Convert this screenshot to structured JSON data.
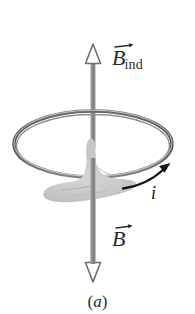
{
  "figure": {
    "caption": {
      "open_paren": "(",
      "letter": "a",
      "close_paren": ")",
      "full": "(a)"
    },
    "labels": {
      "b_induced": {
        "symbol": "B",
        "subscript": "ind",
        "full": "B_ind",
        "vector_arrow": "→",
        "color": "#2b2b2b"
      },
      "b_field": {
        "symbol": "B",
        "subscript": "",
        "full": "B",
        "vector_arrow": "→",
        "color": "#2b2b2b"
      },
      "current": {
        "symbol": "i",
        "full": "i",
        "color": "#141414"
      }
    },
    "elements": {
      "axis_arrow_up": {
        "name": "B-induced vertical arrow pointing up",
        "direction": "up",
        "head_style": "hollow-triangle",
        "shaft_color": "#8d8d8d",
        "outline_color": "#6f6f6f"
      },
      "axis_arrow_down": {
        "name": "B vertical arrow pointing down",
        "direction": "down",
        "head_style": "hollow-triangle",
        "shaft_color": "#8d8d8d",
        "outline_color": "#6f6f6f"
      },
      "conducting_loop": {
        "name": "circular conducting loop drawn in perspective as ellipse",
        "stroke_color": "#5e5e5e",
        "fill": "none"
      },
      "right_hand": {
        "name": "right hand silhouette with thumb up",
        "fill_color": "#c9c9c9",
        "description": "grey hand gripping the axis, thumb pointing along B_ind"
      },
      "current_arrow": {
        "name": "curved current direction arrow",
        "color": "#161616",
        "direction": "counterclockwise-as-seen-from-above"
      }
    }
  }
}
